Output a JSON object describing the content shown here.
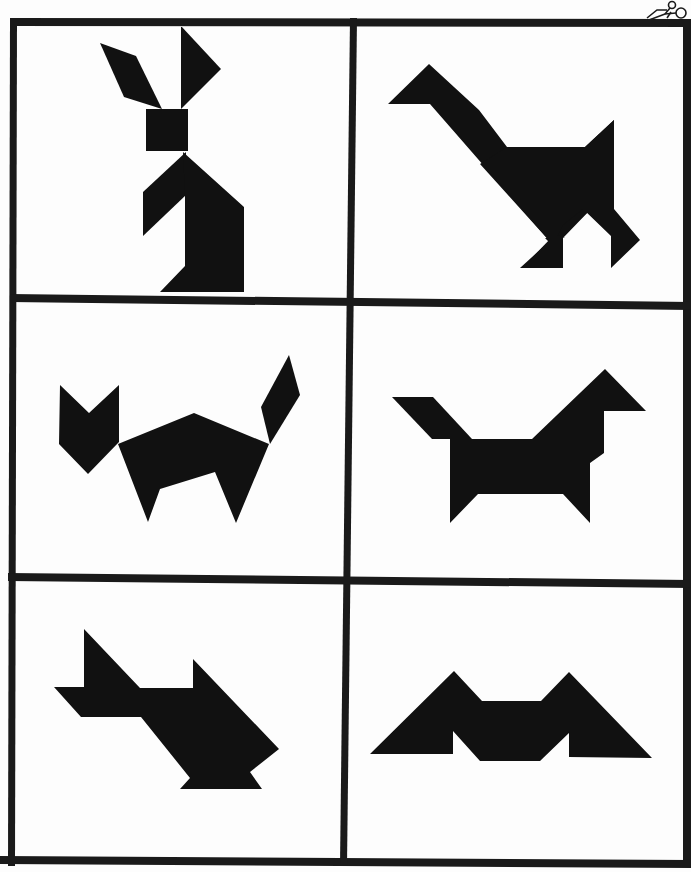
{
  "sheet": {
    "title": "Tangram puzzle cards",
    "cut_icon": "scissors-icon",
    "colors": {
      "paper": "#fdfdfd",
      "ink": "#111111",
      "border": "#1a1a1a"
    }
  },
  "cards": [
    {
      "label": "Rabbit",
      "row": 1,
      "col": 1
    },
    {
      "label": "Goose",
      "row": 1,
      "col": 2
    },
    {
      "label": "Cat",
      "row": 2,
      "col": 1
    },
    {
      "label": "Horse",
      "row": 2,
      "col": 2
    },
    {
      "label": "Swan",
      "row": 3,
      "col": 1
    },
    {
      "label": "Bat",
      "row": 3,
      "col": 2
    }
  ]
}
